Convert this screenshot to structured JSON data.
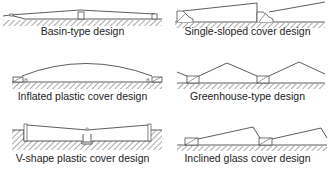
{
  "figure": {
    "panels": [
      {
        "id": "basin",
        "caption": "Basin-type design"
      },
      {
        "id": "single-sloped",
        "caption": "Single-sloped cover design"
      },
      {
        "id": "inflated",
        "caption": "Inflated plastic cover design"
      },
      {
        "id": "greenhouse",
        "caption": "Greenhouse-type design"
      },
      {
        "id": "v-shape",
        "caption": "V-shape plastic cover design"
      },
      {
        "id": "inclined-glass",
        "caption": "Inclined glass cover design"
      }
    ],
    "colors": {
      "line": "#333333",
      "hatch": "#555555",
      "background": "#ffffff"
    }
  }
}
